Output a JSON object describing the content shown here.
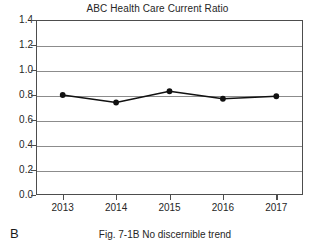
{
  "figure": {
    "panel_label": "B",
    "caption": "Fig. 7-1B No discernible trend"
  },
  "chart_data": {
    "type": "line",
    "title": "ABC Health Care Current Ratio",
    "xlabel": "",
    "ylabel": "",
    "categories": [
      "2013",
      "2014",
      "2015",
      "2016",
      "2017"
    ],
    "values": [
      0.8,
      0.74,
      0.83,
      0.77,
      0.79
    ],
    "ylim": [
      0.0,
      1.4
    ],
    "y_ticks": [
      "1.4",
      "1.2",
      "1.0",
      "0.8",
      "0.6",
      "0.4",
      "0.2",
      "0.0"
    ],
    "y_tick_values": [
      1.4,
      1.2,
      1.0,
      0.8,
      0.6,
      0.4,
      0.2,
      0.0
    ],
    "grid": true,
    "legend": false,
    "marker": "filled-circle",
    "line_color": "#111111",
    "marker_color": "#111111",
    "grid_color": "#8c8c8c",
    "axis_color": "#4d4d4d",
    "annotation": "No discernible trend"
  }
}
